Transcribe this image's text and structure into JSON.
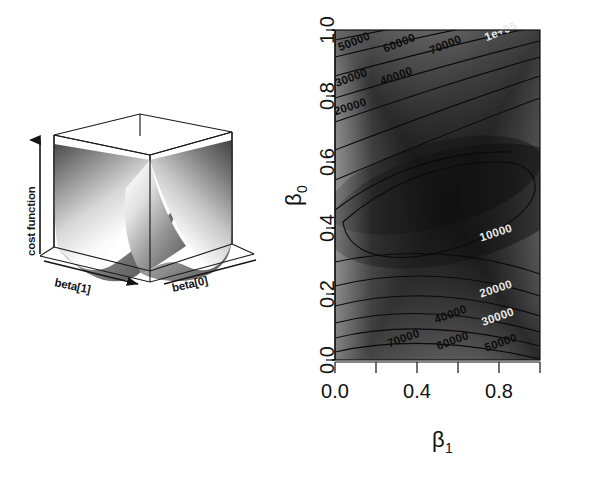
{
  "figure": {
    "panels": [
      {
        "id": "surface-3d",
        "kind": "perspective-surface"
      },
      {
        "id": "contour-2d",
        "kind": "contour-heatmap"
      }
    ]
  },
  "surface3d": {
    "z_axis_label": "cost function",
    "x_axis_label": "beta[1]",
    "y_axis_label": "beta[0]",
    "surface_description": "convex paraboloid valley",
    "box_color": "#1a1a1a",
    "surface_light": "#f2f2f2",
    "surface_dark": "#3a3a3a"
  },
  "chart_data": {
    "type": "heatmap",
    "title": "",
    "xlabel": "β",
    "xlabel_sub": "1",
    "ylabel": "β",
    "ylabel_sub": "0",
    "xlim": [
      0.0,
      1.0
    ],
    "ylim": [
      0.0,
      1.0
    ],
    "xticks": [
      0.0,
      0.2,
      0.4,
      0.6,
      0.8,
      1.0
    ],
    "xticklabels": [
      "0.0",
      "",
      "0.4",
      "",
      "0.8",
      ""
    ],
    "yticks": [
      0.0,
      0.2,
      0.4,
      0.6,
      0.8,
      1.0
    ],
    "yticklabels": [
      "0.0",
      "0.2",
      "0.4",
      "0.6",
      "0.8",
      "1.0"
    ],
    "grid": false,
    "legend": "none",
    "colormap": "grayscale-terrain",
    "contour_levels": [
      10000,
      20000,
      30000,
      40000,
      50000,
      60000,
      70000,
      80000,
      90000,
      100000
    ],
    "contour_labels": [
      {
        "text": "50000",
        "x": 0.1,
        "y": 0.955,
        "angle": -22,
        "tone": "dark"
      },
      {
        "text": "60000",
        "x": 0.32,
        "y": 0.95,
        "angle": -22,
        "tone": "dark"
      },
      {
        "text": "70000",
        "x": 0.545,
        "y": 0.945,
        "angle": -22,
        "tone": "dark"
      },
      {
        "text": "1e+05",
        "x": 0.815,
        "y": 0.985,
        "angle": -22,
        "tone": "light"
      },
      {
        "text": "30000",
        "x": 0.085,
        "y": 0.845,
        "angle": -20,
        "tone": "dark"
      },
      {
        "text": "40000",
        "x": 0.305,
        "y": 0.85,
        "angle": -20,
        "tone": "dark"
      },
      {
        "text": "20000",
        "x": 0.08,
        "y": 0.757,
        "angle": -18,
        "tone": "dark"
      },
      {
        "text": "10000",
        "x": 0.79,
        "y": 0.375,
        "angle": -18,
        "tone": "light"
      },
      {
        "text": "20000",
        "x": 0.79,
        "y": 0.205,
        "angle": -18,
        "tone": "light"
      },
      {
        "text": "30000",
        "x": 0.8,
        "y": 0.12,
        "angle": -20,
        "tone": "light"
      },
      {
        "text": "40000",
        "x": 0.57,
        "y": 0.128,
        "angle": -20,
        "tone": "dark"
      },
      {
        "text": "50000",
        "x": 0.815,
        "y": 0.042,
        "angle": -20,
        "tone": "dark"
      },
      {
        "text": "60000",
        "x": 0.58,
        "y": 0.048,
        "angle": -20,
        "tone": "dark"
      },
      {
        "text": "70000",
        "x": 0.34,
        "y": 0.055,
        "angle": -20,
        "tone": "dark"
      }
    ]
  }
}
